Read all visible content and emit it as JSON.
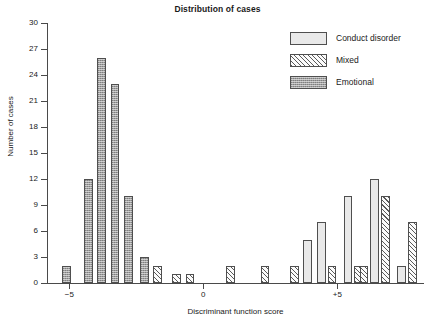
{
  "chart_data": {
    "type": "bar",
    "title": "Distribution of cases",
    "xlabel": "Discriminant function score",
    "ylabel": "Number of cases",
    "xlim": [
      -5.8,
      8.2
    ],
    "ylim": [
      0,
      30
    ],
    "ytick_values": [
      0,
      3,
      6,
      9,
      12,
      15,
      18,
      21,
      24,
      27,
      30
    ],
    "ytick_labels": [
      "0",
      "3",
      "6",
      "9",
      "12",
      "15",
      "18",
      "21",
      "24",
      "27",
      "30"
    ],
    "xtick_values": [
      -5,
      0,
      5
    ],
    "xtick_labels": [
      "−5",
      "0",
      "+5"
    ],
    "grid": false,
    "legend_position": "top-right",
    "bar_width": 0.33,
    "series": [
      {
        "name": "Conduct disorder",
        "style": "light-gray-solid",
        "color": "#e9e9e9",
        "points": [
          {
            "x": 3.9,
            "y": 5
          },
          {
            "x": 4.4,
            "y": 7
          },
          {
            "x": 5.4,
            "y": 10
          },
          {
            "x": 6.4,
            "y": 12
          },
          {
            "x": 7.4,
            "y": 2
          }
        ]
      },
      {
        "name": "Mixed",
        "style": "diagonal-hatch",
        "color": "#ffffff",
        "points": [
          {
            "x": -1.7,
            "y": 2
          },
          {
            "x": -1.0,
            "y": 1
          },
          {
            "x": -0.5,
            "y": 1
          },
          {
            "x": 1.0,
            "y": 2
          },
          {
            "x": 2.3,
            "y": 2
          },
          {
            "x": 3.4,
            "y": 2
          },
          {
            "x": 4.8,
            "y": 2
          },
          {
            "x": 5.8,
            "y": 2
          },
          {
            "x": 6.0,
            "y": 2
          },
          {
            "x": 6.8,
            "y": 10
          },
          {
            "x": 7.8,
            "y": 7
          }
        ]
      },
      {
        "name": "Emotional",
        "style": "dark-gray-stipple",
        "color": "#9e9e9e",
        "points": [
          {
            "x": -5.1,
            "y": 2
          },
          {
            "x": -4.3,
            "y": 12
          },
          {
            "x": -3.8,
            "y": 26
          },
          {
            "x": -3.3,
            "y": 23
          },
          {
            "x": -2.8,
            "y": 10
          },
          {
            "x": -2.2,
            "y": 3
          }
        ]
      }
    ]
  },
  "legend": {
    "items": [
      {
        "label": "Conduct disorder",
        "key": "conduct"
      },
      {
        "label": "Mixed",
        "key": "mixed"
      },
      {
        "label": "Emotional",
        "key": "emotional"
      }
    ]
  }
}
